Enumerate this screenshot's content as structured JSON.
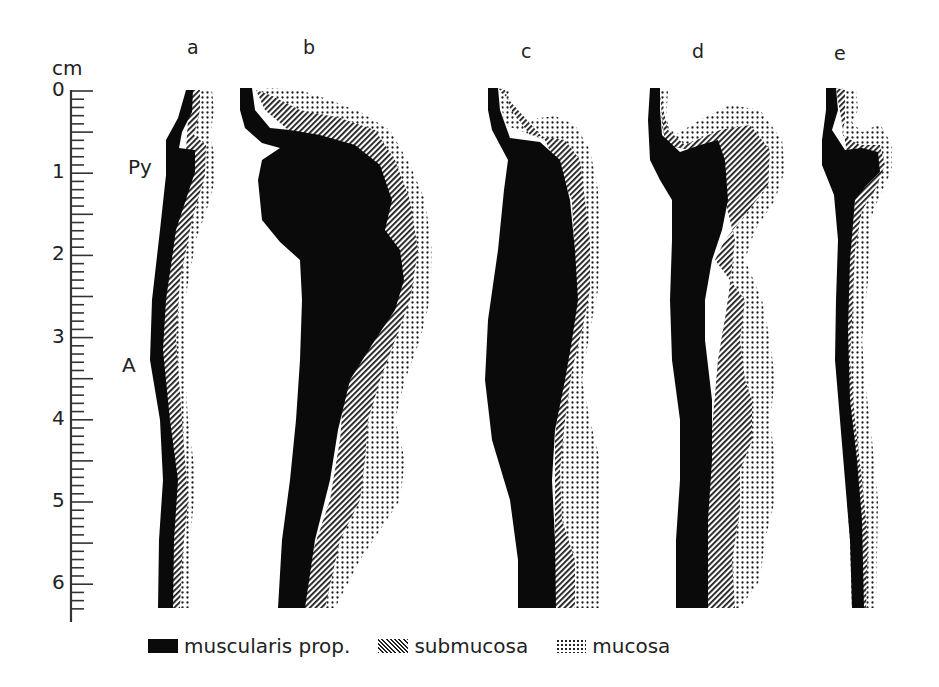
{
  "figure": {
    "type": "anatomical longitudinal wall-layer profiles (pylorus / antrum)",
    "scale": {
      "unit_label": "cm",
      "major_ticks": [
        "0",
        "1",
        "2",
        "3",
        "4",
        "5",
        "6"
      ],
      "minor_divisions_per_cm": 10,
      "range_cm": [
        0,
        6.3
      ]
    },
    "region_labels": {
      "pylorus": "Py",
      "antrum": "A"
    },
    "panels": [
      {
        "id": "a",
        "label": "a",
        "description": "thin normal wall; small pyloric thickening at ~0.8 cm"
      },
      {
        "id": "b",
        "label": "b",
        "description": "marked hypertrophic pyloric bulge ~0.7-1.8 cm with thick muscularis tapering distally"
      },
      {
        "id": "c",
        "label": "c",
        "description": "diffusely thickened muscularis along entire length, maximum ~3-4 cm"
      },
      {
        "id": "d",
        "label": "d",
        "description": "muscular pyloric knob with wide, irregular submucosa and mucosa"
      },
      {
        "id": "e",
        "label": "e",
        "description": "small pyloric knob at ~1 cm, thin distal wall"
      }
    ]
  },
  "legend": {
    "items": [
      {
        "key": "muscularis",
        "label": "muscularis prop.",
        "pattern": "solid black"
      },
      {
        "key": "submucosa",
        "label": "submucosa",
        "pattern": "diagonal hatching"
      },
      {
        "key": "mucosa",
        "label": "mucosa",
        "pattern": "dot stipple"
      }
    ]
  },
  "colors": {
    "ink": "#0a0a0a",
    "background": "#ffffff"
  }
}
